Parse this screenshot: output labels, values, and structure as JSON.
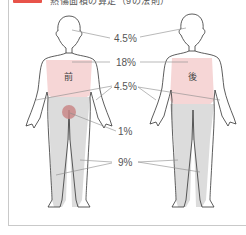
{
  "header": {
    "tag_color": "#e8534a",
    "text": "熱傷面積の算定（9の法則）"
  },
  "figure": {
    "front_label": "前",
    "back_label": "後",
    "labels": {
      "head": "4.5%",
      "trunk": "18%",
      "arms": "4.5%",
      "genitals": "1%",
      "legs": "9%"
    },
    "colors": {
      "trunk_fill": "#f6d6d6",
      "leg_fill": "#d9d9d9",
      "genital_fill": "#c98787",
      "outline": "#333333",
      "leader": "#888888"
    }
  }
}
